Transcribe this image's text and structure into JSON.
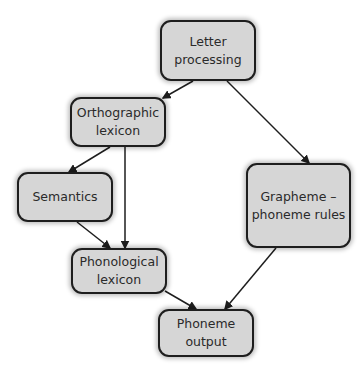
{
  "diagram": {
    "nodes": [
      {
        "id": "letter",
        "label": "Letter\nprocessing"
      },
      {
        "id": "ortho",
        "label": "Orthographic\nlexicon"
      },
      {
        "id": "sem",
        "label": "Semantics"
      },
      {
        "id": "gpc",
        "label": "Grapheme –\nphoneme rules"
      },
      {
        "id": "phon",
        "label": "Phonological\nlexicon"
      },
      {
        "id": "output",
        "label": "Phoneme\noutput"
      }
    ],
    "edges": [
      {
        "from": "letter",
        "to": "ortho"
      },
      {
        "from": "letter",
        "to": "gpc"
      },
      {
        "from": "ortho",
        "to": "sem"
      },
      {
        "from": "ortho",
        "to": "phon"
      },
      {
        "from": "sem",
        "to": "phon"
      },
      {
        "from": "phon",
        "to": "output"
      },
      {
        "from": "gpc",
        "to": "output"
      }
    ],
    "colors": {
      "node_fill": "#d6d6d6",
      "border": "#1e1e1e",
      "edge": "#1e1e1e"
    }
  }
}
